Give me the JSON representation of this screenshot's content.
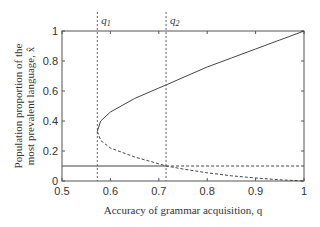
{
  "chart_data": {
    "type": "line",
    "title": "",
    "xlabel": "Accuracy of grammar acquisition, q",
    "ylabel_line1": "Population proportion of the",
    "ylabel_line2": "most prevalent language, x̂",
    "xlim": [
      0.5,
      1.0
    ],
    "ylim": [
      0,
      1
    ],
    "xticks": [
      "0.5",
      "0.6",
      "0.7",
      "0.8",
      "0.9",
      "1"
    ],
    "yticks": [
      "0",
      "0.2",
      "0.4",
      "0.6",
      "0.8",
      "1"
    ],
    "grid": false,
    "legend": null,
    "annotations": [
      {
        "label": "q1",
        "x": 0.573,
        "style": "dotted-vertical"
      },
      {
        "label": "q2",
        "x": 0.715,
        "style": "dotted-vertical"
      }
    ],
    "series": [
      {
        "name": "stable branch (upper)",
        "style": "solid",
        "x": [
          0.573,
          0.58,
          0.6,
          0.65,
          0.7,
          0.715,
          0.75,
          0.8,
          0.85,
          0.9,
          0.95,
          1.0
        ],
        "y": [
          0.33,
          0.4,
          0.46,
          0.55,
          0.62,
          0.64,
          0.69,
          0.76,
          0.82,
          0.88,
          0.94,
          1.0
        ]
      },
      {
        "name": "unstable branch (lower)",
        "style": "dashed",
        "x": [
          0.573,
          0.58,
          0.6,
          0.65,
          0.7,
          0.715,
          0.75,
          0.8,
          0.85,
          0.9,
          0.95,
          1.0
        ],
        "y": [
          0.33,
          0.27,
          0.22,
          0.16,
          0.115,
          0.1,
          0.08,
          0.055,
          0.035,
          0.02,
          0.008,
          0.0
        ]
      },
      {
        "name": "symmetric solution (stable)",
        "style": "solid",
        "x": [
          0.5,
          0.715
        ],
        "y": [
          0.1,
          0.1
        ]
      },
      {
        "name": "symmetric solution (unstable)",
        "style": "dashed",
        "x": [
          0.715,
          1.0
        ],
        "y": [
          0.1,
          0.1
        ]
      }
    ]
  }
}
